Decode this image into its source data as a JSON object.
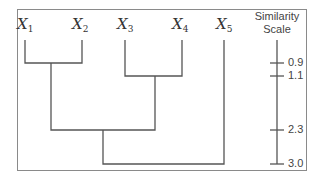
{
  "diagram": {
    "type": "dendrogram",
    "leaves": [
      {
        "id": "x1",
        "symbol": "X",
        "subscript": "1",
        "x": 25
      },
      {
        "id": "x2",
        "symbol": "X",
        "subscript": "2",
        "x": 82
      },
      {
        "id": "x3",
        "symbol": "X",
        "subscript": "3",
        "x": 125
      },
      {
        "id": "x4",
        "symbol": "X",
        "subscript": "4",
        "x": 182
      },
      {
        "id": "x5",
        "symbol": "X",
        "subscript": "5",
        "x": 224
      }
    ],
    "merges": [
      {
        "children": [
          "X1",
          "X2"
        ],
        "height": 0.9
      },
      {
        "children": [
          "X3",
          "X4"
        ],
        "height": 1.1
      },
      {
        "children": [
          "X1X2",
          "X3X4"
        ],
        "height": 2.3
      },
      {
        "children": [
          "X1X2X3X4",
          "X5"
        ],
        "height": 3.0
      }
    ],
    "scale": {
      "title_line1": "Similarity",
      "title_line2": "Scale",
      "ticks": [
        {
          "label": "0.9",
          "y": 63
        },
        {
          "label": "1.1",
          "y": 76
        },
        {
          "label": "2.3",
          "y": 130
        },
        {
          "label": "3.0",
          "y": 164
        }
      ]
    },
    "line_color": "#555555"
  }
}
